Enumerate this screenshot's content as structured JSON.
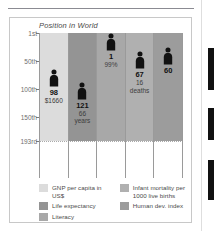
{
  "top_strip": {
    "ghost_text": "• • ••••••  •••••"
  },
  "scrollbar": {
    "name": "vertical-scrollbar"
  },
  "chart_data": {
    "type": "bar",
    "title": "Position in World",
    "xlabel": "",
    "ylabel": "",
    "grid": true,
    "legend_position": "bottom",
    "axis_note": "y-axis is world ranking, 1st at top, 193rd at bottom (inverted)",
    "ylim": [
      1,
      193
    ],
    "yticks": [
      "1st",
      "50th",
      "100th",
      "150th",
      "193rd"
    ],
    "ytick_values": [
      1,
      50,
      100,
      150,
      193
    ],
    "categories": [
      "GNP per capita in US$",
      "Life expectancy",
      "Literacy",
      "Infant mortality per 1000 live births",
      "Human dev. index"
    ],
    "values": [
      98,
      121,
      1,
      67,
      60
    ],
    "series": [
      {
        "name": "Position in World",
        "values": [
          98,
          121,
          1,
          67,
          60
        ]
      }
    ],
    "points": [
      {
        "category": "GNP per capita in US$",
        "rank": "98",
        "rank_value": 98,
        "annotation": "$1660",
        "color": "#dcdcdc"
      },
      {
        "category": "Life expectancy",
        "rank": "121",
        "rank_value": 121,
        "annotation": "66\nyears",
        "annotation_line1": "66",
        "annotation_line2": "years",
        "color": "#949494"
      },
      {
        "category": "Literacy",
        "rank": "1",
        "rank_value": 1,
        "annotation": "99%",
        "color": "#a8a8a8"
      },
      {
        "category": "Infant mortality per 1000 live births",
        "rank": "67",
        "rank_value": 67,
        "annotation": "16\ndeaths",
        "annotation_line1": "16",
        "annotation_line2": "deaths",
        "color": "#b0b0b0"
      },
      {
        "category": "Human dev. index",
        "rank": "60",
        "rank_value": 60,
        "annotation": "",
        "color": "#9c9c9c"
      }
    ],
    "legend": [
      {
        "label": "GNP per capita in US$",
        "color": "#dcdcdc"
      },
      {
        "label": "Life expectancy",
        "color": "#949494"
      },
      {
        "label": "Literacy",
        "color": "#a8a8a8"
      },
      {
        "label": "Infant mortality per",
        "label_line2": "1000 live births",
        "color": "#b0b0b0"
      },
      {
        "label": "Human dev. index",
        "color": "#9c9c9c"
      }
    ]
  }
}
